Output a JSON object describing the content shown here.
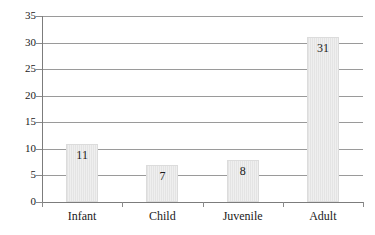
{
  "chart_data": {
    "type": "bar",
    "title": "",
    "xlabel": "",
    "ylabel": "",
    "categories": [
      "Infant",
      "Child",
      "Juvenile",
      "Adult"
    ],
    "values": [
      11,
      7,
      8,
      31
    ],
    "value_labels": [
      "11",
      "7",
      "8",
      "31"
    ],
    "ylim": [
      0,
      35
    ],
    "ytick_values": [
      0,
      5,
      10,
      15,
      20,
      25,
      30,
      35
    ],
    "ytick_labels": [
      "0",
      "5",
      "10",
      "15",
      "20",
      "25",
      "30",
      "35"
    ],
    "grid": "horizontal",
    "legend": "none",
    "bar_color": "#e9e9e9",
    "bar_border_color": "#dcdcdc",
    "gridline_color": "#9a9a9a",
    "axis_color": "#7c7c7c",
    "text_color": "#1a1a1a"
  },
  "axes": {
    "y_ticks": [
      {
        "label": "35",
        "value": 35
      },
      {
        "label": "30",
        "value": 30
      },
      {
        "label": "25",
        "value": 25
      },
      {
        "label": "20",
        "value": 20
      },
      {
        "label": "15",
        "value": 15
      },
      {
        "label": "10",
        "value": 10
      },
      {
        "label": "5",
        "value": 5
      },
      {
        "label": "0",
        "value": 0
      }
    ],
    "x_categories": [
      {
        "label": "Infant",
        "value": 11,
        "value_label": "11"
      },
      {
        "label": "Child",
        "value": 7,
        "value_label": "7"
      },
      {
        "label": "Juvenile",
        "value": 8,
        "value_label": "8"
      },
      {
        "label": "Adult",
        "value": 31,
        "value_label": "31"
      }
    ]
  }
}
